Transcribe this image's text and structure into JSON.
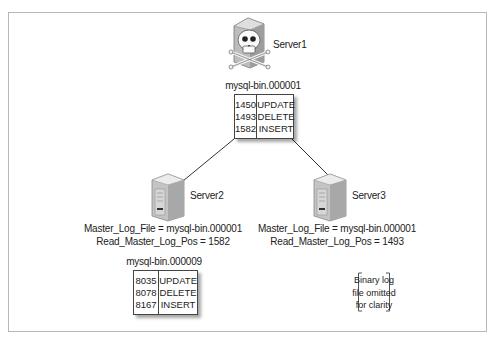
{
  "diagram": {
    "servers": [
      {
        "id": "server1",
        "label": "Server1",
        "state": "failed",
        "icon": "server-skull-icon"
      },
      {
        "id": "server2",
        "label": "Server2",
        "icon": "server-icon",
        "status_lines": [
          "Master_Log_File = mysql-bin.000001",
          "Read_Master_Log_Pos = 1582"
        ]
      },
      {
        "id": "server3",
        "label": "Server3",
        "icon": "server-icon",
        "status_lines": [
          "Master_Log_File = mysql-bin.000001",
          "Read_Master_Log_Pos = 1493"
        ]
      }
    ],
    "binlogs": {
      "server1": {
        "filename": "mysql-bin.000001",
        "rows": [
          {
            "pos": "1450",
            "event": "UPDATE"
          },
          {
            "pos": "1493",
            "event": "DELETE"
          },
          {
            "pos": "1582",
            "event": "INSERT"
          }
        ]
      },
      "server2": {
        "filename": "mysql-bin.000009",
        "rows": [
          {
            "pos": "8035",
            "event": "UPDATE"
          },
          {
            "pos": "8078",
            "event": "DELETE"
          },
          {
            "pos": "8167",
            "event": "INSERT"
          }
        ]
      },
      "server3": {
        "note_lines": [
          "Binary log",
          "file omitted",
          "for clarity"
        ]
      }
    },
    "edges": [
      {
        "from": "server1",
        "to": "server2"
      },
      {
        "from": "server1",
        "to": "server3"
      }
    ]
  }
}
